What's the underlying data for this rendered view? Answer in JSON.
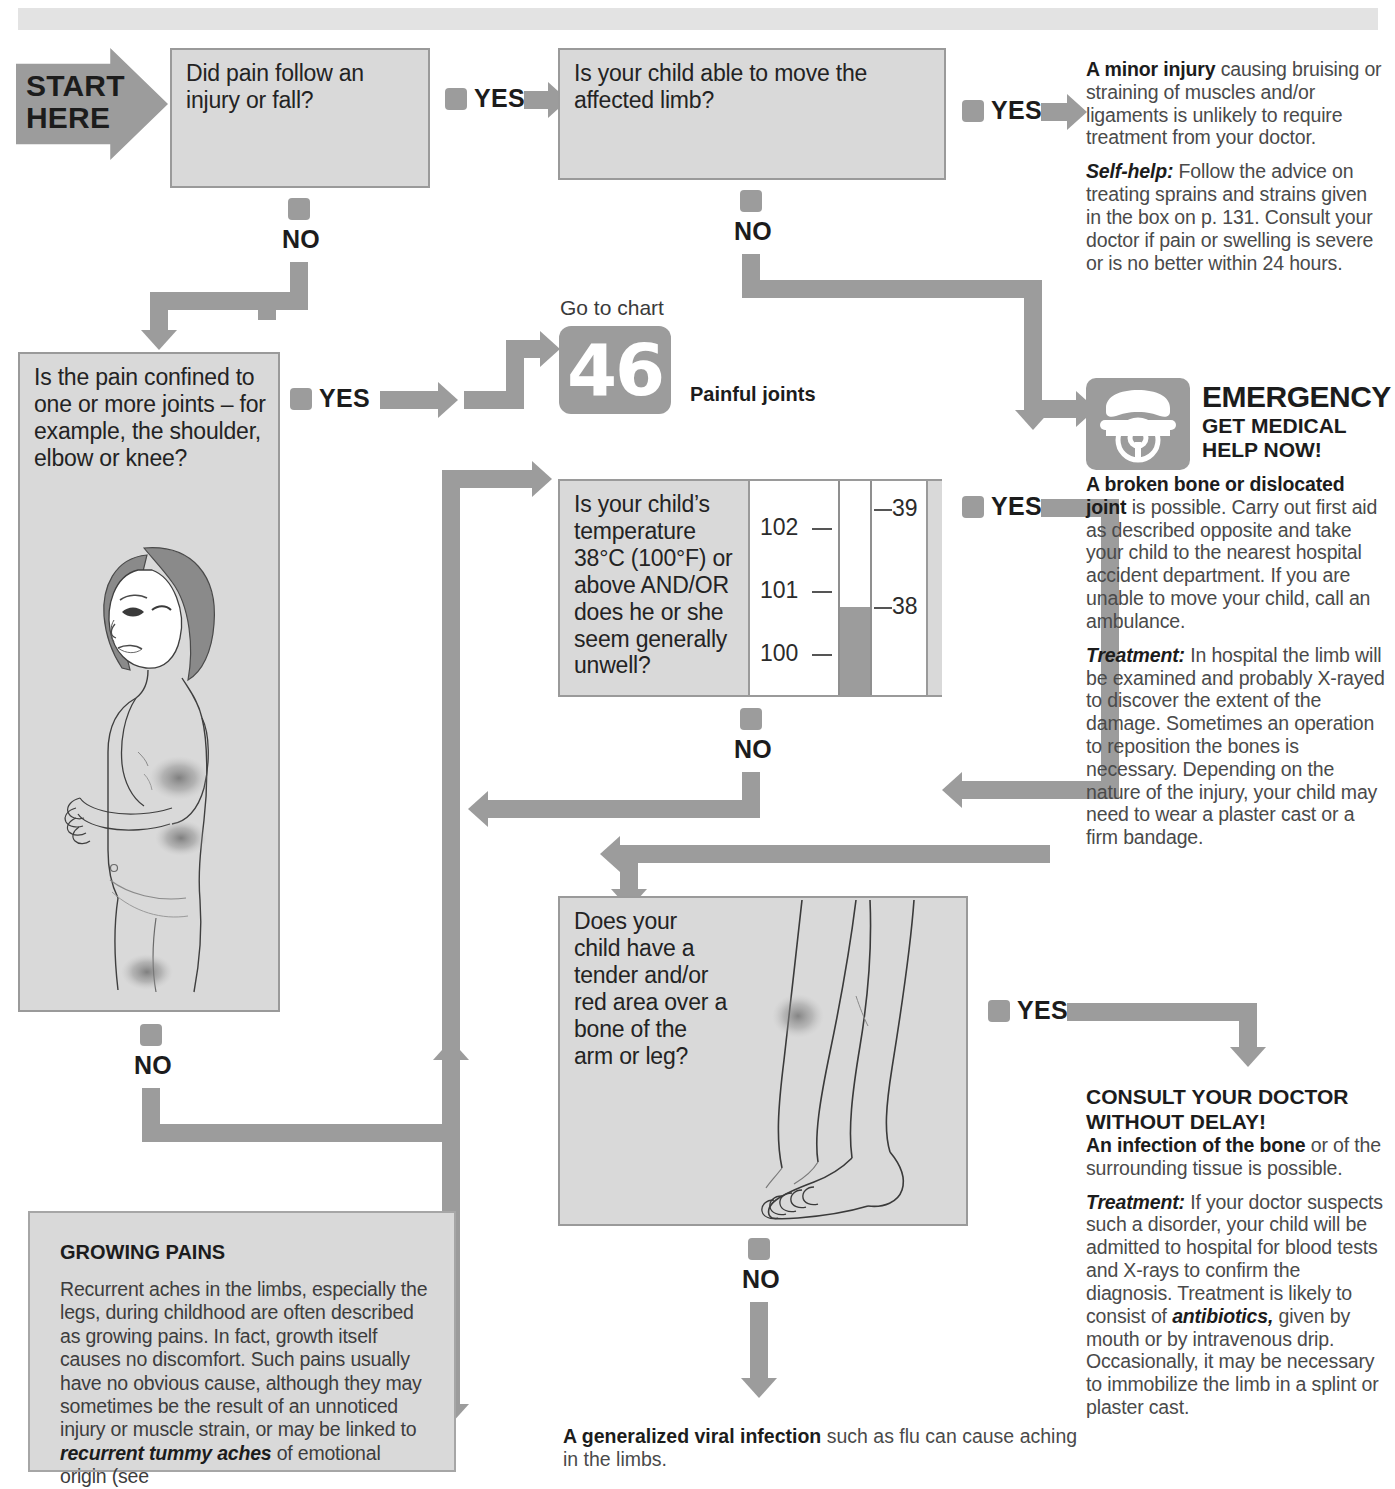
{
  "start": {
    "line1": "START",
    "line2": "HERE"
  },
  "labels": {
    "yes": "YES",
    "no": "NO"
  },
  "questions": {
    "q1": "Did pain follow an injury or fall?",
    "q2": "Is your child able to move the affected limb?",
    "q3": "Is the pain confined to one or more joints – for example, the shoulder, elbow or knee?",
    "q4": "Is your child’s temperature 38°C (100°F) or above AND/OR does he or she seem generally unwell?",
    "q5": "Does your child have a tender and/or red area over a bone of the arm or leg?"
  },
  "goto_chart": {
    "label": "Go to chart",
    "number": "46",
    "caption": "Painful joints"
  },
  "minor_injury": {
    "lead": "A minor injury",
    "para1": " causing bruising or straining of muscles and/or ligaments is unlikely to require treatment from your doctor.",
    "selfhelp_lead": "Self-help:",
    "para2": " Follow the advice on treating sprains and strains given in the box on p. 131. Consult your doctor if pain or swelling is severe or is no better within 24 hours."
  },
  "emergency": {
    "title": "EMERGENCY",
    "subtitle_line1": "GET MEDICAL",
    "subtitle_line2": "HELP NOW!",
    "lead": "A broken bone or dislocated joint",
    "para1": " is possible. Carry out first aid as described opposite and take your child to the nearest hospital accident department. If you are unable to move your child, call an ambulance.",
    "treatment_lead": "Treatment:",
    "para2": " In hospital the limb will be examined and probably X-rayed to discover the extent of the damage. Sometimes an operation to reposition the bones is necessary. Depending on the nature of the injury, your child may need to wear a plaster cast or a firm bandage."
  },
  "consult": {
    "heading_line1": "CONSULT YOUR DOCTOR",
    "heading_line2": "WITHOUT DELAY!",
    "lead": "An infection of the bone",
    "para1": " or of the surrounding tissue is possible.",
    "treatment_lead": "Treatment:",
    "para2a": " If your doctor suspects such a disorder, your child will be admitted to hospital for blood tests and X-rays to confirm the diagnosis. Treatment is likely to consist of ",
    "antibiotics": "antibiotics,",
    "para2b": " given by mouth or by intravenous drip. Occasionally, it may be necessary to immobilize the limb in a splint or plaster cast."
  },
  "growing_pains": {
    "title": "GROWING PAINS",
    "body1": "Recurrent aches in the limbs, especially the legs, during childhood are often described as growing pains. In fact, growth itself causes no discomfort. Such pains usually have no obvious cause, although they may sometimes be the result of an unnoticed injury or muscle strain, or may be linked to ",
    "italic": "recurrent tummy aches",
    "body2": " of emotional origin (see"
  },
  "viral": {
    "lead": "A generalized viral infection",
    "rest": " such as flu can cause aching in the limbs."
  },
  "thermometer": {
    "fahrenheit_ticks": [
      "102",
      "101",
      "100"
    ],
    "celsius_ticks": [
      "39",
      "38"
    ],
    "mercury_level_label": "38"
  },
  "colors": {
    "flow_gray": "#9c9c9c",
    "box_fill": "#d9d9d9",
    "box_border": "#9a9a9a",
    "text": "#2b2b2b"
  }
}
